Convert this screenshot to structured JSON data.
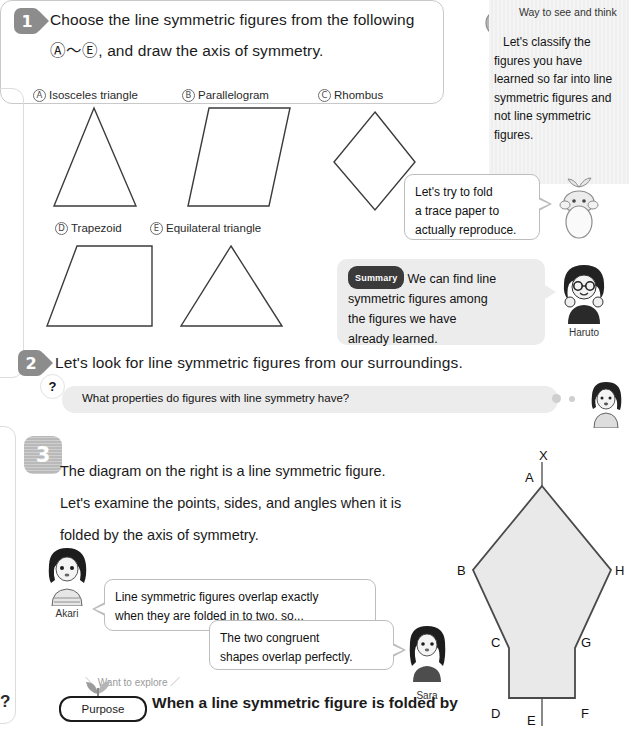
{
  "section1": {
    "number": "1",
    "heading_line1": "Choose the line symmetric figures from the following",
    "heading_line2": ", and draw the axis of symmetry.",
    "range_from": "Ⓐ",
    "range_tilde": "〜",
    "range_to": "Ⓔ",
    "figures": [
      {
        "letter": "A",
        "label": "Isosceles triangle"
      },
      {
        "letter": "B",
        "label": "Parallelogram"
      },
      {
        "letter": "C",
        "label": "Rhombus"
      },
      {
        "letter": "D",
        "label": "Trapezoid"
      },
      {
        "letter": "E",
        "label": "Equilateral triangle"
      }
    ]
  },
  "think_panel": {
    "title": "Way to see and think",
    "body": "Let's classify the figures you have learned so far into line symmetric figures and not line symmetric figures."
  },
  "bubbles": {
    "fold": "Let's try to fold a trace paper to actually reproduce.",
    "fold_lines": [
      "Let's try to fold",
      "a trace paper to",
      "actually reproduce."
    ],
    "summary_badge": "Summary",
    "summary_text": "We can find line symmetric figures among the figures we have already learned.",
    "summary_lines": [
      "We can find line",
      "symmetric figures among",
      "the figures we have",
      "already learned."
    ],
    "akari": "Line symmetric figures overlap exactly when they are folded in to two, so...",
    "akari_lines": [
      "Line symmetric figures overlap exactly",
      "when they are folded in to two, so..."
    ],
    "sara": "The two congruent shapes overlap perfectly.",
    "sara_lines": [
      "The two congruent",
      "shapes overlap perfectly."
    ]
  },
  "characters": {
    "haruto": "Haruto",
    "akari": "Akari",
    "sara": "Sara"
  },
  "section2": {
    "number": "2",
    "heading": "Let's look for line symmetric figures from our surroundings.",
    "question_mark": "?",
    "question": "What properties do figures with line symmetry have?"
  },
  "section3": {
    "number": "3",
    "lines": [
      "The diagram on the right is a line symmetric figure.",
      "Let's examine the points, sides, and angles when it is",
      "folded by the axis of symmetry."
    ]
  },
  "purpose": {
    "want_to_explore": "＼ Want to explore ／",
    "question_mark": "?",
    "badge": "Purpose",
    "text": "When a line symmetric figure is folded by"
  },
  "diagram": {
    "axis_label": "X",
    "vertices": [
      "A",
      "B",
      "C",
      "D",
      "E",
      "F",
      "G",
      "H"
    ],
    "fill_color": "#e9e9e9",
    "stroke_color": "#4a4a4a"
  },
  "colors": {
    "badge_gray": "#8c8c8c",
    "bubble_border": "#bdbdbd",
    "gray_bubble": "#ececec",
    "text": "#1b1b1b"
  }
}
